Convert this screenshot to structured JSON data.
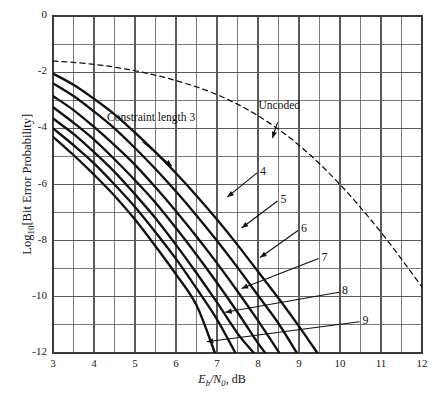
{
  "chart_data": {
    "type": "line",
    "title": "",
    "xlabel": "Eb/N0, dB",
    "ylabel": "Log10[Bit Error Probability]",
    "xlim": [
      3,
      12
    ],
    "ylim": [
      -12,
      0
    ],
    "xticks": [
      3,
      4,
      5,
      6,
      7,
      8,
      9,
      10,
      11,
      12
    ],
    "yticks": [
      0,
      -2,
      -4,
      -6,
      -8,
      -10,
      -12
    ],
    "x_minor_step": 0.5,
    "y_minor_step": 1,
    "grid": true,
    "legend_position": "inline-annotations",
    "annotations": [
      {
        "text": "Uncoded",
        "x": 8.55,
        "y": -3.45,
        "points_to": {
          "x": 8.35,
          "y": -4.35
        }
      },
      {
        "text": "Constraint length 3",
        "x": 5.0,
        "y": -4.25,
        "points_to": {
          "x": 5.9,
          "y": -5.35
        }
      }
    ],
    "series": [
      {
        "name": "Uncoded",
        "style": "dashed",
        "points": [
          [
            3,
            -1.6
          ],
          [
            4,
            -1.72
          ],
          [
            5,
            -1.95
          ],
          [
            6,
            -2.3
          ],
          [
            7,
            -2.8
          ],
          [
            8,
            -3.55
          ],
          [
            9,
            -4.6
          ],
          [
            10,
            -6.0
          ],
          [
            11,
            -7.7
          ],
          [
            12,
            -9.65
          ]
        ]
      },
      {
        "name": "Constraint length 3",
        "label": "3",
        "style": "solid",
        "points": [
          [
            3,
            -2.05
          ],
          [
            3.5,
            -2.45
          ],
          [
            4,
            -2.95
          ],
          [
            4.5,
            -3.5
          ],
          [
            5,
            -4.15
          ],
          [
            5.5,
            -4.85
          ],
          [
            6,
            -5.6
          ],
          [
            6.5,
            -6.4
          ],
          [
            7,
            -7.25
          ],
          [
            7.5,
            -8.15
          ],
          [
            8,
            -9.1
          ],
          [
            8.5,
            -10.05
          ],
          [
            9,
            -11.05
          ],
          [
            9.45,
            -12.0
          ]
        ]
      },
      {
        "name": "Constraint length 4",
        "label": "4",
        "style": "solid",
        "points": [
          [
            3,
            -2.4
          ],
          [
            3.5,
            -2.85
          ],
          [
            4,
            -3.4
          ],
          [
            4.5,
            -4.0
          ],
          [
            5,
            -4.7
          ],
          [
            5.5,
            -5.45
          ],
          [
            6,
            -6.25
          ],
          [
            6.5,
            -7.1
          ],
          [
            7,
            -8.0
          ],
          [
            7.5,
            -8.95
          ],
          [
            8,
            -9.95
          ],
          [
            8.5,
            -10.95
          ],
          [
            8.95,
            -12.0
          ]
        ]
      },
      {
        "name": "Constraint length 5",
        "label": "5",
        "style": "solid",
        "points": [
          [
            3,
            -2.85
          ],
          [
            3.5,
            -3.35
          ],
          [
            4,
            -3.95
          ],
          [
            4.5,
            -4.6
          ],
          [
            5,
            -5.3
          ],
          [
            5.5,
            -6.1
          ],
          [
            6,
            -6.95
          ],
          [
            6.5,
            -7.85
          ],
          [
            7,
            -8.8
          ],
          [
            7.5,
            -9.8
          ],
          [
            8,
            -10.85
          ],
          [
            8.5,
            -11.95
          ],
          [
            8.52,
            -12.0
          ]
        ]
      },
      {
        "name": "Constraint length 6",
        "label": "6",
        "style": "solid",
        "points": [
          [
            3,
            -3.25
          ],
          [
            3.5,
            -3.8
          ],
          [
            4,
            -4.4
          ],
          [
            4.5,
            -5.1
          ],
          [
            5,
            -5.85
          ],
          [
            5.5,
            -6.65
          ],
          [
            6,
            -7.55
          ],
          [
            6.5,
            -8.5
          ],
          [
            7,
            -9.5
          ],
          [
            7.5,
            -10.55
          ],
          [
            8,
            -11.65
          ],
          [
            8.18,
            -12.0
          ]
        ]
      },
      {
        "name": "Constraint length 7",
        "label": "7",
        "style": "solid",
        "points": [
          [
            3,
            -3.65
          ],
          [
            3.5,
            -4.2
          ],
          [
            4,
            -4.85
          ],
          [
            4.5,
            -5.55
          ],
          [
            5,
            -6.35
          ],
          [
            5.5,
            -7.2
          ],
          [
            6,
            -8.15
          ],
          [
            6.5,
            -9.15
          ],
          [
            7,
            -10.2
          ],
          [
            7.5,
            -11.3
          ],
          [
            7.9,
            -12.0
          ]
        ]
      },
      {
        "name": "Constraint length 8",
        "label": "8",
        "style": "solid",
        "points": [
          [
            3,
            -4.0
          ],
          [
            3.5,
            -4.6
          ],
          [
            4,
            -5.25
          ],
          [
            4.5,
            -6.0
          ],
          [
            5,
            -6.8
          ],
          [
            5.5,
            -7.7
          ],
          [
            6,
            -8.65
          ],
          [
            6.5,
            -9.7
          ],
          [
            7,
            -10.8
          ],
          [
            7.45,
            -12.0
          ]
        ]
      },
      {
        "name": "Constraint length 9",
        "label": "9",
        "style": "solid",
        "points": [
          [
            3,
            -4.3
          ],
          [
            3.5,
            -4.95
          ],
          [
            4,
            -5.65
          ],
          [
            4.5,
            -6.4
          ],
          [
            5,
            -7.25
          ],
          [
            5.5,
            -8.2
          ],
          [
            6,
            -9.2
          ],
          [
            6.5,
            -10.3
          ],
          [
            6.95,
            -12.0
          ]
        ]
      }
    ],
    "curve_labels": [
      {
        "text": "4",
        "x": 8.05,
        "y": -5.55,
        "leader_to": {
          "x": 7.25,
          "y": -6.45
        }
      },
      {
        "text": "5",
        "x": 8.55,
        "y": -6.55,
        "leader_to": {
          "x": 7.6,
          "y": -7.55
        }
      },
      {
        "text": "6",
        "x": 9.05,
        "y": -7.6,
        "leader_to": {
          "x": 8.05,
          "y": -8.6
        }
      },
      {
        "text": "7",
        "x": 9.55,
        "y": -8.6,
        "leader_to": {
          "x": 7.6,
          "y": -9.7
        }
      },
      {
        "text": "8",
        "x": 10.05,
        "y": -9.8,
        "leader_to": {
          "x": 7.2,
          "y": -10.55
        }
      },
      {
        "text": "9",
        "x": 10.55,
        "y": -10.85,
        "leader_to": {
          "x": 6.75,
          "y": -11.6
        }
      }
    ]
  },
  "axes": {
    "x_tick_labels": [
      "3",
      "4",
      "5",
      "6",
      "7",
      "8",
      "9",
      "10",
      "11",
      "12"
    ],
    "y_tick_labels": [
      "0",
      "-2",
      "-4",
      "-6",
      "-8",
      "-10",
      "-12"
    ],
    "x_title_main": "E",
    "x_title_sub1": "b",
    "x_title_slash": "/N",
    "x_title_sub2": "0",
    "x_title_units": ", dB",
    "y_title_prefix": "Log",
    "y_title_sub": "10",
    "y_title_rest": "[Bit Error Probability]"
  },
  "colors": {
    "curve": "#111111",
    "grid": "#5a5a5a",
    "frame": "#3a3a3a",
    "text": "#1a1a1a",
    "background": "#ffffff"
  }
}
